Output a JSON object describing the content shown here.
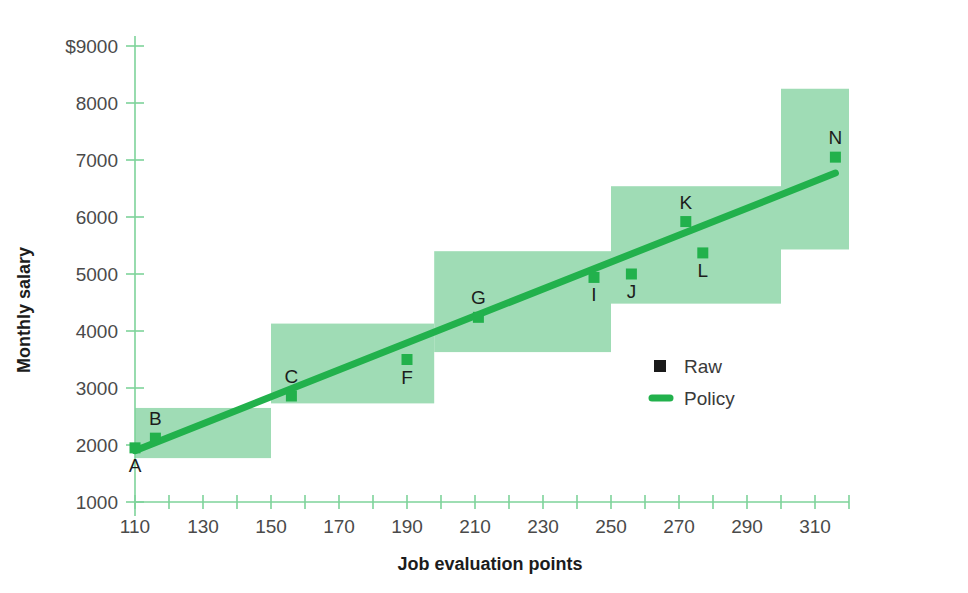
{
  "chart_data": {
    "type": "scatter",
    "title": "",
    "xlabel": "Job evaluation points",
    "ylabel": "Monthly salary",
    "xlim": [
      110,
      320
    ],
    "ylim": [
      1000,
      9000
    ],
    "grid": false,
    "legend_position": "inside-right",
    "x_ticks": [
      110,
      120,
      130,
      140,
      150,
      160,
      170,
      180,
      190,
      200,
      210,
      220,
      230,
      240,
      250,
      260,
      270,
      280,
      290,
      300,
      310,
      320
    ],
    "x_tick_labels": [
      "110",
      "",
      "130",
      "",
      "150",
      "",
      "170",
      "",
      "190",
      "",
      "210",
      "",
      "230",
      "",
      "250",
      "",
      "270",
      "",
      "290",
      "",
      "310",
      ""
    ],
    "y_ticks": [
      1000,
      2000,
      3000,
      4000,
      5000,
      6000,
      7000,
      8000,
      9000
    ],
    "y_tick_labels": [
      "1000",
      "2000",
      "3000",
      "4000",
      "5000",
      "6000",
      "7000",
      "8000",
      "$9000"
    ],
    "legend": [
      {
        "name": "Raw",
        "marker": "square",
        "color": "#1a1a1a"
      },
      {
        "name": "Policy",
        "marker": "line",
        "color": "#22b14c"
      }
    ],
    "series": [
      {
        "name": "Raw",
        "marker": "square",
        "color": "#22b14c",
        "points": [
          {
            "label": "A",
            "x": 110,
            "y": 1950,
            "label_pos": "below"
          },
          {
            "label": "B",
            "x": 116,
            "y": 2120,
            "label_pos": "above"
          },
          {
            "label": "C",
            "x": 156,
            "y": 2860,
            "label_pos": "above"
          },
          {
            "label": "F",
            "x": 190,
            "y": 3500,
            "label_pos": "below"
          },
          {
            "label": "G",
            "x": 211,
            "y": 4240,
            "label_pos": "above"
          },
          {
            "label": "I",
            "x": 245,
            "y": 4940,
            "label_pos": "below"
          },
          {
            "label": "J",
            "x": 256,
            "y": 5000,
            "label_pos": "below"
          },
          {
            "label": "K",
            "x": 272,
            "y": 5920,
            "label_pos": "above"
          },
          {
            "label": "L",
            "x": 277,
            "y": 5370,
            "label_pos": "below"
          },
          {
            "label": "N",
            "x": 316,
            "y": 7050,
            "label_pos": "above"
          }
        ]
      },
      {
        "name": "Policy",
        "marker": "line",
        "color": "#22b14c",
        "x": [
          110,
          316
        ],
        "y": [
          1900,
          6770
        ]
      }
    ],
    "bands": [
      {
        "x_start": 110,
        "x_end": 150,
        "y_bottom": 1770,
        "y_top": 2650,
        "color": "#9fdcb5"
      },
      {
        "x_start": 150,
        "x_end": 198,
        "y_bottom": 2730,
        "y_top": 4130,
        "color": "#9fdcb5"
      },
      {
        "x_start": 198,
        "x_end": 250,
        "y_bottom": 3630,
        "y_top": 5400,
        "color": "#9fdcb5"
      },
      {
        "x_start": 250,
        "x_end": 300,
        "y_bottom": 4480,
        "y_top": 6540,
        "color": "#9fdcb5"
      },
      {
        "x_start": 300,
        "x_end": 320,
        "y_bottom": 5430,
        "y_top": 8250,
        "color": "#9fdcb5"
      }
    ],
    "axis_color": "#7ed39a",
    "band_color": "#9fdcb5",
    "accent_color": "#22b14c"
  }
}
